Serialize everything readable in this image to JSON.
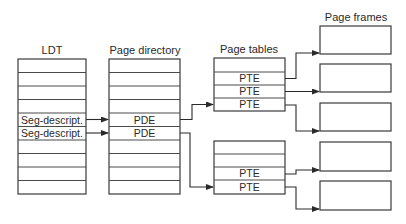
{
  "diagram": {
    "type": "memory-paging-structure",
    "columns": {
      "ldt": {
        "title": "LDT",
        "rows": [
          "",
          "",
          "",
          "",
          "Seg-descript.",
          "Seg-descript.",
          "",
          "",
          "",
          ""
        ]
      },
      "page_directory": {
        "title": "Page directory",
        "rows": [
          "",
          "",
          "",
          "",
          "PDE",
          "PDE",
          "",
          "",
          "",
          ""
        ]
      },
      "page_tables": {
        "title": "Page tables",
        "tables": [
          {
            "rows": [
              "",
              "PTE",
              "PTE",
              "PTE"
            ]
          },
          {
            "rows": [
              "",
              "",
              "PTE",
              "PTE"
            ]
          }
        ]
      },
      "page_frames": {
        "title": "Page frames",
        "count": 5
      }
    },
    "edges": [
      {
        "from": "ldt.row4",
        "to": "page_directory.row4"
      },
      {
        "from": "ldt.row5",
        "to": "page_directory.row5"
      },
      {
        "from": "page_directory.row4",
        "to": "page_tables.0.row3"
      },
      {
        "from": "page_directory.row5",
        "to": "page_tables.1.row3"
      },
      {
        "from": "page_tables.0.row1",
        "to": "page_frames.0"
      },
      {
        "from": "page_tables.0.row2",
        "to": "page_frames.1"
      },
      {
        "from": "page_tables.0.row3",
        "to": "page_frames.2"
      },
      {
        "from": "page_tables.1.row2",
        "to": "page_frames.3"
      },
      {
        "from": "page_tables.1.row3",
        "to": "page_frames.4"
      }
    ],
    "colors": {
      "line": "#3a3a3a",
      "text": "#2a2a2a",
      "background": "#ffffff"
    }
  }
}
